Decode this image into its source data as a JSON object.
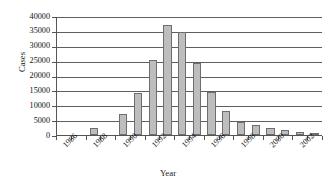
{
  "chart_data": {
    "type": "bar",
    "title": "",
    "xlabel": "Year",
    "ylabel": "Cases",
    "ylim": [
      0,
      40000
    ],
    "ytick_values": [
      0,
      5000,
      10000,
      15000,
      20000,
      25000,
      30000,
      35000,
      40000
    ],
    "ytick_labels": [
      "0",
      "5000",
      "10000",
      "15000",
      "20000",
      "25000",
      "30000",
      "35000",
      "40000"
    ],
    "grid": true,
    "legend": null,
    "xtick_labels": [
      "1986",
      "1988",
      "1990",
      "1992",
      "1994",
      "1996",
      "1998",
      "2000",
      "2002"
    ],
    "categories": [
      "1986",
      "1987",
      "1988",
      "1989",
      "1990",
      "1991",
      "1992",
      "1993",
      "1994",
      "1995",
      "1996",
      "1997",
      "1998",
      "1999",
      "2000",
      "2001",
      "2002",
      "2003"
    ],
    "values": [
      0,
      0,
      2300,
      0,
      7000,
      14200,
      25100,
      37000,
      34500,
      24200,
      14600,
      8200,
      4400,
      3500,
      2400,
      1600,
      1000,
      500
    ]
  },
  "axes": {
    "y_axis_title": "Cases",
    "x_axis_title": "Year"
  }
}
